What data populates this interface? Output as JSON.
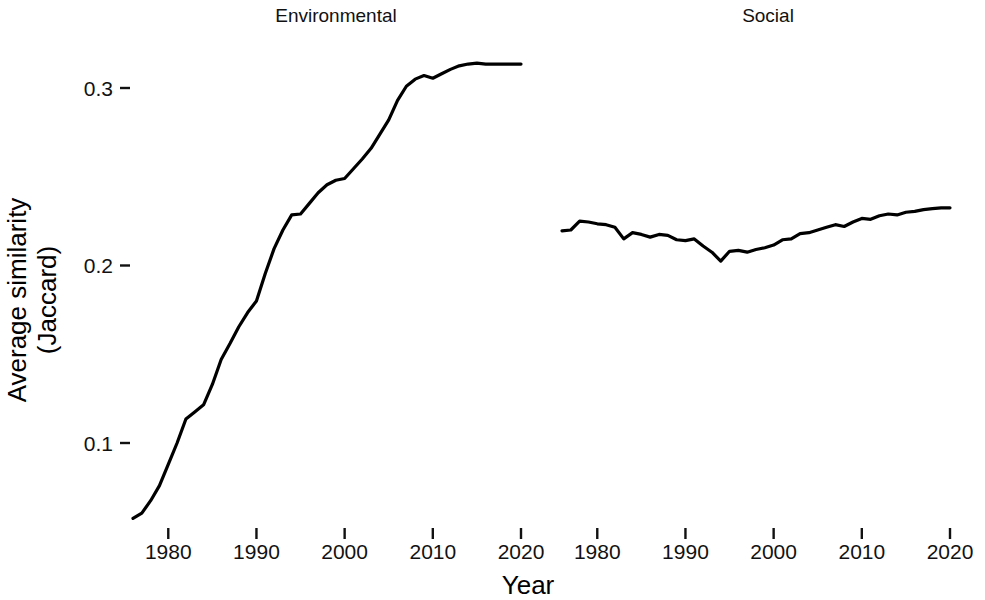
{
  "chart_data": {
    "type": "line",
    "title": "",
    "xlabel": "Year",
    "ylabel": "Average similarity\n(Jaccard)",
    "ylabel_line1": "Average similarity",
    "ylabel_line2": "(Jaccard)",
    "grid": false,
    "legend": "none",
    "facets": [
      "Environmental",
      "Social"
    ],
    "xlim": [
      1975,
      2021
    ],
    "ylim": [
      0.05,
      0.318
    ],
    "xticks": [
      1980,
      1990,
      2000,
      2010,
      2020
    ],
    "xtick_labels": [
      "1980",
      "1990",
      "2000",
      "2010",
      "2020"
    ],
    "yticks": [
      0.1,
      0.2,
      0.3
    ],
    "ytick_labels": [
      "0.1",
      "0.2",
      "0.3"
    ],
    "line_color": "#000000",
    "panels": [
      {
        "name": "Environmental",
        "x": [
          1976,
          1977,
          1978,
          1979,
          1980,
          1981,
          1982,
          1983,
          1984,
          1985,
          1986,
          1987,
          1988,
          1989,
          1990,
          1991,
          1992,
          1993,
          1994,
          1995,
          1996,
          1997,
          1998,
          1999,
          2000,
          2001,
          2002,
          2003,
          2004,
          2005,
          2006,
          2007,
          2008,
          2009,
          2010,
          2011,
          2012,
          2013,
          2014,
          2015,
          2016,
          2017,
          2018,
          2019,
          2020
        ],
        "y": [
          0.0575,
          0.0605,
          0.0675,
          0.076,
          0.088,
          0.1,
          0.1135,
          0.1175,
          0.1215,
          0.133,
          0.147,
          0.156,
          0.1655,
          0.1735,
          0.18,
          0.1955,
          0.2095,
          0.22,
          0.2285,
          0.229,
          0.235,
          0.241,
          0.2455,
          0.248,
          0.249,
          0.2545,
          0.26,
          0.266,
          0.274,
          0.282,
          0.293,
          0.301,
          0.305,
          0.307,
          0.3055,
          0.308,
          0.3105,
          0.3125,
          0.3135,
          0.314,
          0.3135,
          0.3135,
          0.3135,
          0.3135,
          0.3135
        ]
      },
      {
        "name": "Social",
        "x": [
          1976,
          1977,
          1978,
          1979,
          1980,
          1981,
          1982,
          1983,
          1984,
          1985,
          1986,
          1987,
          1988,
          1989,
          1990,
          1991,
          1992,
          1993,
          1994,
          1995,
          1996,
          1997,
          1998,
          1999,
          2000,
          2001,
          2002,
          2003,
          2004,
          2005,
          2006,
          2007,
          2008,
          2009,
          2010,
          2011,
          2012,
          2013,
          2014,
          2015,
          2016,
          2017,
          2018,
          2019,
          2020
        ],
        "y": [
          0.2195,
          0.22,
          0.225,
          0.2245,
          0.2235,
          0.223,
          0.2215,
          0.215,
          0.2185,
          0.2175,
          0.216,
          0.2175,
          0.217,
          0.2145,
          0.214,
          0.215,
          0.211,
          0.2075,
          0.2025,
          0.208,
          0.2085,
          0.2075,
          0.209,
          0.21,
          0.2115,
          0.2145,
          0.215,
          0.218,
          0.2185,
          0.22,
          0.2215,
          0.223,
          0.222,
          0.2245,
          0.2265,
          0.226,
          0.228,
          0.229,
          0.2285,
          0.23,
          0.2305,
          0.2315,
          0.232,
          0.2325,
          0.2325
        ]
      }
    ]
  }
}
